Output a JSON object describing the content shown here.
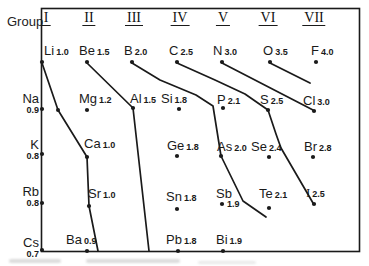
{
  "figure": {
    "group_label": "Group",
    "background": "#ffffff",
    "ink": "#1a1a1a"
  },
  "chart_data": {
    "type": "scatter",
    "xlabel": "Group",
    "x_categories": [
      "I",
      "II",
      "III",
      "IV",
      "V",
      "VI",
      "VII"
    ],
    "x_centers": [
      46,
      89,
      134,
      180,
      223,
      268,
      314
    ],
    "periods": [
      2,
      3,
      4,
      5,
      6
    ],
    "box": {
      "x1": 41,
      "y1": 8,
      "x2": 359,
      "y2": 251
    },
    "points": [
      {
        "symbol": "Li",
        "en": "1.0",
        "group": "I",
        "period": 2,
        "x": 42,
        "y": 62,
        "lx": 44,
        "ly": 44,
        "variant": "above"
      },
      {
        "symbol": "Be",
        "en": "1.5",
        "group": "II",
        "period": 2,
        "x": 87,
        "y": 62,
        "lx": 79,
        "ly": 44,
        "variant": "above"
      },
      {
        "symbol": "B",
        "en": "2.0",
        "group": "III",
        "period": 2,
        "x": 132,
        "y": 62,
        "lx": 124,
        "ly": 44,
        "variant": "above"
      },
      {
        "symbol": "C",
        "en": "2.5",
        "group": "IV",
        "period": 2,
        "x": 177,
        "y": 62,
        "lx": 169,
        "ly": 44,
        "variant": "above"
      },
      {
        "symbol": "N",
        "en": "3.0",
        "group": "V",
        "period": 2,
        "x": 222,
        "y": 62,
        "lx": 213,
        "ly": 44,
        "variant": "above"
      },
      {
        "symbol": "O",
        "en": "3.5",
        "group": "VI",
        "period": 2,
        "x": 270,
        "y": 62,
        "lx": 263,
        "ly": 44,
        "variant": "above"
      },
      {
        "symbol": "F",
        "en": "4.0",
        "group": "VII",
        "period": 2,
        "x": 316,
        "y": 62,
        "lx": 311,
        "ly": 44,
        "variant": "above"
      },
      {
        "symbol": "Na",
        "en": "0.9",
        "group": "I",
        "period": 3,
        "x": 42,
        "y": 109,
        "ly": 93,
        "variant": "axis"
      },
      {
        "symbol": "Mg",
        "en": "1.2",
        "group": "II",
        "period": 3,
        "x": 87,
        "y": 110,
        "lx": 79,
        "ly": 92,
        "variant": "above"
      },
      {
        "symbol": "Al",
        "en": "1.5",
        "group": "III",
        "period": 3,
        "x": 133,
        "y": 108,
        "lx": 130,
        "ly": 92,
        "variant": "above"
      },
      {
        "symbol": "Si",
        "en": "1.8",
        "group": "IV",
        "period": 3,
        "x": 179,
        "y": 109,
        "lx": 161,
        "ly": 92,
        "variant": "above"
      },
      {
        "symbol": "P",
        "en": "2.1",
        "group": "V",
        "period": 3,
        "x": 223,
        "y": 108,
        "lx": 217,
        "ly": 93,
        "variant": "above"
      },
      {
        "symbol": "S",
        "en": "2.5",
        "group": "VI",
        "period": 3,
        "x": 268,
        "y": 110,
        "lx": 260,
        "ly": 93,
        "variant": "above"
      },
      {
        "symbol": "Cl",
        "en": "3.0",
        "group": "VII",
        "period": 3,
        "x": 314,
        "y": 111,
        "lx": 303,
        "ly": 94,
        "variant": "above"
      },
      {
        "symbol": "K",
        "en": "0.8",
        "group": "I",
        "period": 4,
        "x": 42,
        "y": 154,
        "ly": 139,
        "variant": "axis"
      },
      {
        "symbol": "Ca",
        "en": "1.0",
        "group": "II",
        "period": 4,
        "x": 87,
        "y": 157,
        "lx": 84,
        "ly": 137,
        "variant": "above"
      },
      {
        "symbol": "Ge",
        "en": "1.8",
        "group": "IV",
        "period": 4,
        "x": 177,
        "y": 156,
        "lx": 167,
        "ly": 139,
        "variant": "above"
      },
      {
        "symbol": "As",
        "en": "2.0",
        "group": "V",
        "period": 4,
        "x": 221,
        "y": 156,
        "lx": 217,
        "ly": 140,
        "variant": "above"
      },
      {
        "symbol": "Se",
        "en": "2.4",
        "group": "VI",
        "period": 4,
        "x": 269,
        "y": 157,
        "lx": 251,
        "ly": 140,
        "variant": "above"
      },
      {
        "symbol": "Br",
        "en": "2.8",
        "group": "VII",
        "period": 4,
        "x": 313,
        "y": 157,
        "lx": 304,
        "ly": 140,
        "variant": "above"
      },
      {
        "symbol": "Rb",
        "en": "0.8",
        "group": "I",
        "period": 5,
        "x": 42,
        "y": 203,
        "ly": 186,
        "variant": "axis"
      },
      {
        "symbol": "Sr",
        "en": "1.0",
        "group": "II",
        "period": 5,
        "x": 89,
        "y": 206,
        "lx": 88,
        "ly": 187,
        "variant": "above"
      },
      {
        "symbol": "Sn",
        "en": "1.8",
        "group": "IV",
        "period": 5,
        "x": 177,
        "y": 209,
        "lx": 166,
        "ly": 190,
        "variant": "above"
      },
      {
        "symbol": "Sb",
        "en": "1.9",
        "group": "V",
        "period": 5,
        "x": 222,
        "y": 204,
        "lx": 216,
        "ly": 187,
        "vx": 227,
        "vy": 199,
        "variant": "value-below"
      },
      {
        "symbol": "Te",
        "en": "2.1",
        "group": "VI",
        "period": 5,
        "x": 269,
        "y": 208,
        "lx": 259,
        "ly": 187,
        "variant": "above"
      },
      {
        "symbol": "I",
        "en": "2.5",
        "group": "VII",
        "period": 5,
        "x": 314,
        "y": 204,
        "lx": 306,
        "ly": 186,
        "variant": "above",
        "serif": true
      },
      {
        "symbol": "Cs",
        "en": "0.7",
        "group": "I",
        "period": 6,
        "x": 42,
        "y": 250,
        "ly": 237,
        "variant": "axis"
      },
      {
        "symbol": "Ba",
        "en": "0.9",
        "group": "II",
        "period": 6,
        "x": 87,
        "y": 251,
        "lx": 66,
        "ly": 233,
        "variant": "above"
      },
      {
        "symbol": "Pb",
        "en": "1.8",
        "group": "IV",
        "period": 6,
        "x": 178,
        "y": 251,
        "lx": 166,
        "ly": 233,
        "variant": "above"
      },
      {
        "symbol": "Bi",
        "en": "1.9",
        "group": "V",
        "period": 6,
        "x": 223,
        "y": 251,
        "lx": 216,
        "ly": 233,
        "variant": "above"
      }
    ],
    "unlabeled_point": {
      "x": 58,
      "y": 110
    },
    "iso_lines": [
      {
        "level": "1.0",
        "path": [
          [
            42,
            63
          ],
          [
            58,
            110
          ],
          [
            87,
            157
          ],
          [
            89,
            206
          ],
          [
            98,
            251
          ]
        ]
      },
      {
        "level": "1.5",
        "path": [
          [
            87,
            63
          ],
          [
            133,
            108
          ],
          [
            149,
            251
          ]
        ]
      },
      {
        "level": "2.0",
        "path": [
          [
            132,
            63
          ],
          [
            160,
            80
          ],
          [
            196,
            95
          ],
          [
            213,
            106
          ],
          [
            221,
            156
          ],
          [
            243,
            201
          ],
          [
            266,
            217
          ]
        ]
      },
      {
        "level": "2.5",
        "path": [
          [
            177,
            63
          ],
          [
            215,
            80
          ],
          [
            245,
            94
          ],
          [
            268,
            110
          ],
          [
            276,
            134
          ],
          [
            281,
            148
          ],
          [
            313,
            203
          ]
        ]
      },
      {
        "level": "3.0",
        "path": [
          [
            222,
            63
          ],
          [
            313,
            110
          ]
        ]
      },
      {
        "level": "3.5",
        "path": [
          [
            270,
            63
          ],
          [
            310,
            83
          ]
        ]
      }
    ]
  }
}
